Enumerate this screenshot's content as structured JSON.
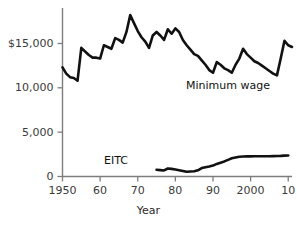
{
  "chart_data": {
    "type": "line",
    "title": "",
    "subtitle": "",
    "xlabel": "Year",
    "ylabel": "",
    "grid": false,
    "legend_position": "inline-annotation",
    "xlim": [
      1950,
      2011
    ],
    "ylim": [
      0,
      19000
    ],
    "x_tick_values": [
      1950,
      1960,
      1970,
      1980,
      1990,
      2000,
      2010
    ],
    "x_tick_labels": [
      "1950",
      "60",
      "70",
      "80",
      "90",
      "2000",
      "10"
    ],
    "y_tick_values": [
      0,
      5000,
      10000,
      15000
    ],
    "y_tick_labels": [
      "0",
      "5,000",
      "10,000",
      "$15,000"
    ],
    "annotations": [
      {
        "text": "Minimum wage",
        "series": "Minimum wage"
      },
      {
        "text": "EITC",
        "series": "EITC"
      }
    ],
    "series": [
      {
        "name": "Minimum wage",
        "color": "#111111",
        "x": [
          1950,
          1951,
          1952,
          1953,
          1954,
          1955,
          1956,
          1957,
          1958,
          1959,
          1960,
          1961,
          1962,
          1963,
          1964,
          1965,
          1966,
          1967,
          1968,
          1969,
          1970,
          1971,
          1972,
          1973,
          1974,
          1975,
          1976,
          1977,
          1978,
          1979,
          1980,
          1981,
          1982,
          1983,
          1984,
          1985,
          1986,
          1987,
          1988,
          1989,
          1990,
          1991,
          1992,
          1993,
          1994,
          1995,
          1996,
          1997,
          1998,
          1999,
          2000,
          2001,
          2002,
          2003,
          2004,
          2005,
          2006,
          2007,
          2008,
          2009,
          2010,
          2011
        ],
        "y": [
          12300,
          11600,
          11200,
          11100,
          10800,
          14500,
          14100,
          13700,
          13400,
          13400,
          13300,
          14800,
          14600,
          14400,
          15600,
          15400,
          15100,
          16300,
          18200,
          17300,
          16400,
          15700,
          15200,
          14500,
          15900,
          16300,
          15900,
          15400,
          16600,
          16100,
          16700,
          16300,
          15400,
          14800,
          14300,
          13800,
          13600,
          13100,
          12600,
          12000,
          11700,
          12900,
          12600,
          12200,
          12000,
          11700,
          12600,
          13300,
          14400,
          13800,
          13400,
          13000,
          12800,
          12500,
          12200,
          11900,
          11600,
          11400,
          13300,
          15300,
          14800,
          14600
        ]
      },
      {
        "name": "EITC",
        "color": "#111111",
        "x": [
          1975,
          1976,
          1977,
          1978,
          1979,
          1980,
          1981,
          1982,
          1983,
          1984,
          1985,
          1986,
          1987,
          1988,
          1989,
          1990,
          1991,
          1992,
          1993,
          1994,
          1995,
          1996,
          1997,
          1998,
          1999,
          2000,
          2001,
          2002,
          2003,
          2004,
          2005,
          2006,
          2007,
          2008,
          2009,
          2010
        ],
        "y": [
          760,
          720,
          680,
          900,
          860,
          780,
          700,
          620,
          530,
          560,
          600,
          700,
          950,
          1050,
          1130,
          1230,
          1420,
          1560,
          1700,
          1880,
          2050,
          2140,
          2230,
          2260,
          2270,
          2270,
          2280,
          2290,
          2280,
          2280,
          2290,
          2300,
          2320,
          2330,
          2350,
          2360
        ]
      }
    ]
  }
}
